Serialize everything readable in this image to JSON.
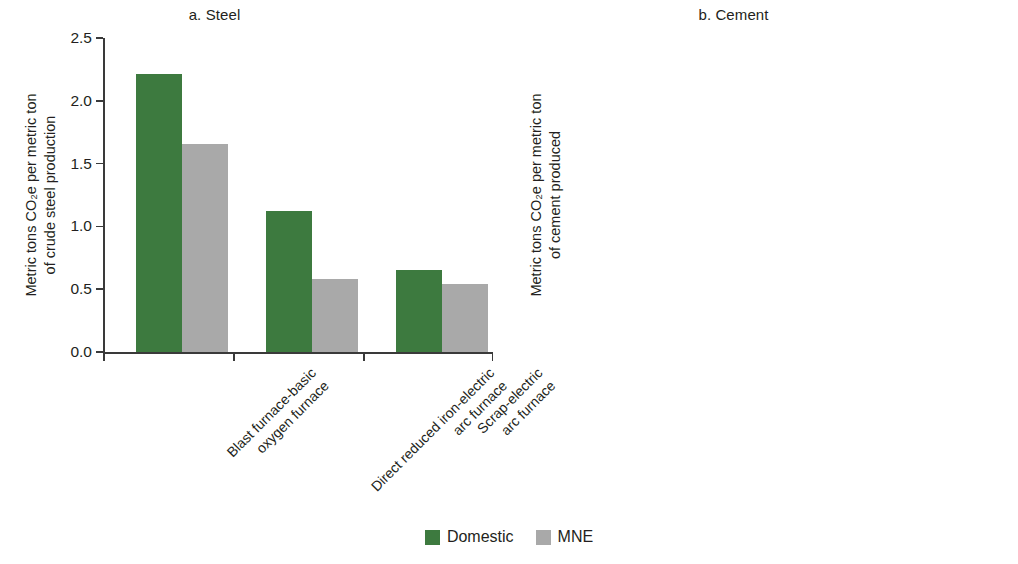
{
  "legend": {
    "position": "bottom-center",
    "entries": [
      {
        "label": "Domestic",
        "color": "#3d7a3f",
        "key": "domestic"
      },
      {
        "label": "MNE",
        "color": "#a9a9a9",
        "key": "mne"
      }
    ]
  },
  "colors": {
    "domestic": "#3d7a3f",
    "mne": "#a9a9a9",
    "axis": "#3a3a3a",
    "text": "#231f20",
    "background": "#ffffff"
  },
  "chart_data": [
    {
      "type": "bar",
      "id": "steel",
      "title": "a. Steel",
      "xlabel": "",
      "ylabel": "Metric tons CO₂e per metric ton of crude steel production",
      "ylabel_line1": "Metric tons CO₂e per metric ton",
      "ylabel_line2": "of crude steel production",
      "ylim": [
        0.0,
        2.5
      ],
      "yticks": [
        0.0,
        0.5,
        1.0,
        1.5,
        2.0,
        2.5
      ],
      "ytick_labels": [
        "0.0",
        "0.5",
        "1.0",
        "1.5",
        "2.0",
        "2.5"
      ],
      "grid": false,
      "categories": [
        "Blast furnace-basic oxygen furnace",
        "Direct reduced iron-electric arc furnace",
        "Scrap-electric arc furnace"
      ],
      "category_lines": [
        [
          "Blast furnace-basic",
          "oxygen furnace"
        ],
        [
          "Direct reduced iron-electric",
          "arc furnace"
        ],
        [
          "Scrap-electric",
          "arc furnace"
        ]
      ],
      "series": [
        {
          "name": "Domestic",
          "key": "domestic",
          "values": [
            2.21,
            1.12,
            0.65
          ]
        },
        {
          "name": "MNE",
          "key": "mne",
          "values": [
            1.66,
            0.58,
            0.54
          ]
        }
      ]
    },
    {
      "type": "bar",
      "id": "cement",
      "title": "b. Cement",
      "xlabel": "",
      "ylabel": "Metric tons CO₂e per metric ton of cement produced",
      "ylabel_line1": "Metric tons CO₂e per metric ton",
      "ylabel_line2": "of cement produced",
      "ylim": [
        0.0,
        3.0
      ],
      "yticks": [
        0.0,
        0.5,
        1.0,
        1.5,
        2.0,
        2.5,
        3.0
      ],
      "ytick_labels": [
        "0.0",
        "0.5",
        "1.0",
        "1.5",
        "2.0",
        "2.5",
        "3.0"
      ],
      "grid": false,
      "categories": [
        "Clinker",
        "Cement equivalent",
        "Cementitious products",
        "Low-CO₂ materials"
      ],
      "category_lines": [
        [
          "Clinker"
        ],
        [
          "Cement equivalent"
        ],
        [
          "Cementitious products"
        ],
        [
          "Low-CO₂ materials"
        ]
      ],
      "series": [
        {
          "name": "Domestic",
          "key": "domestic",
          "values": [
            0.89,
            0.69,
            0.68,
            2.58
          ]
        },
        {
          "name": "MNE",
          "key": "mne",
          "values": [
            0.89,
            0.58,
            0.58,
            0.38
          ]
        }
      ]
    }
  ]
}
